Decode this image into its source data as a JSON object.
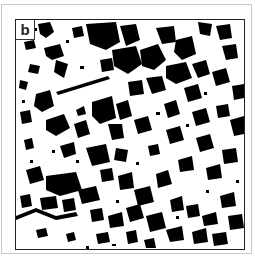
{
  "figure": {
    "panel_label": "b",
    "colors": {
      "patch": "#000000",
      "background": "#ffffff",
      "frame": "#222222",
      "outer_frame": "#c8c8c8"
    }
  }
}
